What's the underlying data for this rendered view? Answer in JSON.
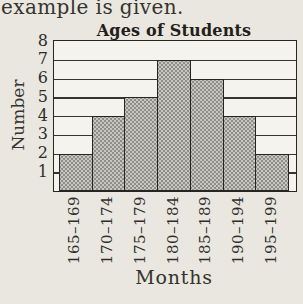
{
  "page": {
    "top_text": "example is given.",
    "background_color": "#e9e7e0"
  },
  "chart_data": {
    "type": "bar",
    "title": "Ages of Students",
    "xlabel": "Months",
    "ylabel": "Number",
    "categories": [
      "165–169",
      "170–174",
      "175–179",
      "180–184",
      "185–189",
      "190–194",
      "195–199"
    ],
    "values": [
      2,
      4,
      5,
      7,
      6,
      4,
      2
    ],
    "yticks": [
      8,
      7,
      6,
      5,
      4,
      3,
      2,
      1
    ],
    "ylim": [
      0,
      8
    ],
    "grid": "on",
    "legend": "none",
    "bar_style": "halftone-dot-gray",
    "colors": {
      "bar_base": "#c7c6c1",
      "bar_dot": "#8f8e8a",
      "line": "#262520",
      "plot_background": "#f4f3ee",
      "page_background": "#e9e7e0",
      "text": "#2e2d2a"
    }
  }
}
